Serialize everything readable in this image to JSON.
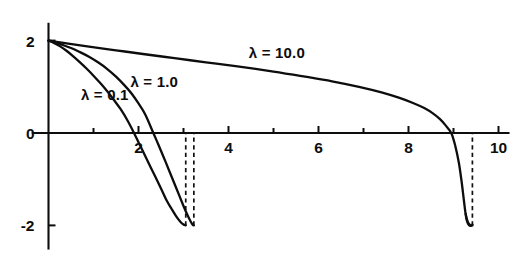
{
  "chart_data": {
    "type": "line",
    "title": "",
    "xlabel": "",
    "ylabel": "",
    "xlim": [
      -0.35,
      10.55
    ],
    "ylim": [
      -2.55,
      2.45
    ],
    "grid": false,
    "legend_position": "inline-annotations",
    "x_ticks": [
      2,
      4,
      6,
      8,
      10
    ],
    "x_tick_labels": [
      "2",
      "4",
      "6",
      "8",
      "10"
    ],
    "x_minor_ticks": [
      1,
      3,
      5,
      7,
      9
    ],
    "y_ticks": [
      2,
      0,
      -2
    ],
    "y_tick_labels": [
      "2",
      "0",
      "-2"
    ],
    "axis_color": "#0d0d0d",
    "curve_color": "#0d0d0d",
    "series": [
      {
        "name": "lambda-0.1",
        "label": "λ = 0.1",
        "label_x": 0.72,
        "label_y": 0.72,
        "terminator_x": 3.05,
        "terminator_y": -2.0,
        "zero_crossing": 1.9,
        "points": [
          [
            0.0,
            2.0
          ],
          [
            0.12,
            1.95
          ],
          [
            0.25,
            1.88
          ],
          [
            0.4,
            1.78
          ],
          [
            0.55,
            1.66
          ],
          [
            0.7,
            1.53
          ],
          [
            0.85,
            1.39
          ],
          [
            1.0,
            1.24
          ],
          [
            1.15,
            1.08
          ],
          [
            1.3,
            0.91
          ],
          [
            1.45,
            0.72
          ],
          [
            1.6,
            0.52
          ],
          [
            1.75,
            0.28
          ],
          [
            1.9,
            0.0
          ],
          [
            2.05,
            -0.3
          ],
          [
            2.2,
            -0.6
          ],
          [
            2.35,
            -0.9
          ],
          [
            2.5,
            -1.2
          ],
          [
            2.62,
            -1.45
          ],
          [
            2.74,
            -1.65
          ],
          [
            2.85,
            -1.82
          ],
          [
            2.94,
            -1.93
          ],
          [
            3.0,
            -1.98
          ],
          [
            3.05,
            -2.0
          ]
        ]
      },
      {
        "name": "lambda-1.0",
        "label": "λ = 1.0",
        "label_x": 1.82,
        "label_y": 1.0,
        "terminator_x": 3.23,
        "terminator_y": -2.0,
        "zero_crossing": 2.33,
        "points": [
          [
            0.0,
            2.0
          ],
          [
            0.15,
            1.96
          ],
          [
            0.3,
            1.91
          ],
          [
            0.5,
            1.84
          ],
          [
            0.7,
            1.75
          ],
          [
            0.9,
            1.65
          ],
          [
            1.1,
            1.53
          ],
          [
            1.3,
            1.39
          ],
          [
            1.5,
            1.22
          ],
          [
            1.7,
            1.02
          ],
          [
            1.85,
            0.85
          ],
          [
            2.0,
            0.64
          ],
          [
            2.15,
            0.4
          ],
          [
            2.33,
            0.0
          ],
          [
            2.45,
            -0.27
          ],
          [
            2.6,
            -0.62
          ],
          [
            2.75,
            -0.98
          ],
          [
            2.9,
            -1.34
          ],
          [
            3.0,
            -1.58
          ],
          [
            3.08,
            -1.76
          ],
          [
            3.15,
            -1.9
          ],
          [
            3.2,
            -1.98
          ],
          [
            3.23,
            -2.0
          ]
        ]
      },
      {
        "name": "lambda-10.0",
        "label": "λ = 10.0",
        "label_x": 4.45,
        "label_y": 1.62,
        "terminator_x": 9.42,
        "terminator_y": -2.0,
        "zero_crossing": 8.95,
        "points": [
          [
            0.0,
            2.0
          ],
          [
            0.4,
            1.94
          ],
          [
            0.9,
            1.87
          ],
          [
            1.5,
            1.79
          ],
          [
            2.1,
            1.71
          ],
          [
            2.8,
            1.62
          ],
          [
            3.5,
            1.53
          ],
          [
            4.2,
            1.44
          ],
          [
            5.0,
            1.33
          ],
          [
            5.7,
            1.22
          ],
          [
            6.3,
            1.12
          ],
          [
            6.9,
            1.0
          ],
          [
            7.4,
            0.88
          ],
          [
            7.8,
            0.76
          ],
          [
            8.1,
            0.65
          ],
          [
            8.35,
            0.54
          ],
          [
            8.55,
            0.42
          ],
          [
            8.7,
            0.3
          ],
          [
            8.82,
            0.17
          ],
          [
            8.95,
            0.0
          ],
          [
            9.04,
            -0.28
          ],
          [
            9.12,
            -0.65
          ],
          [
            9.18,
            -1.05
          ],
          [
            9.23,
            -1.45
          ],
          [
            9.27,
            -1.75
          ],
          [
            9.32,
            -1.93
          ],
          [
            9.38,
            -2.0
          ],
          [
            9.42,
            -2.0
          ]
        ]
      }
    ]
  }
}
